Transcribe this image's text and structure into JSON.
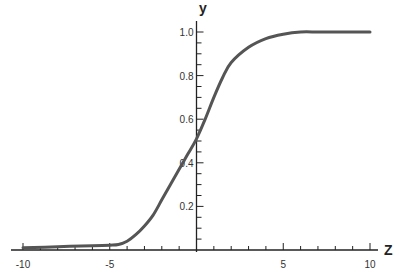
{
  "chart_data": {
    "type": "line",
    "title": "",
    "xlabel": "Z",
    "ylabel": "y",
    "xlim": [
      -10.6,
      11
    ],
    "ylim": [
      0,
      1.05
    ],
    "grid": false,
    "legend": null,
    "x_ticks": [
      -10,
      -5,
      5,
      10
    ],
    "x_tick_labels": [
      "-10",
      "-5",
      "5",
      "10"
    ],
    "x_minor_step": 1,
    "y_ticks": [
      0.2,
      0.4,
      0.6,
      0.8,
      1.0
    ],
    "y_tick_labels": [
      "0.2",
      "0.4",
      "0.6",
      "0.8",
      "1.0"
    ],
    "y_minor_step": 0.05,
    "series": [
      {
        "name": "sigmoid-like curve",
        "color": "#555555",
        "x": [
          -10,
          -8,
          -6,
          -5,
          -4.5,
          -4,
          -3.5,
          -3,
          -2.5,
          -2,
          -1.5,
          -1,
          -0.5,
          0,
          0.5,
          1,
          1.5,
          2,
          3,
          4,
          5,
          6,
          7,
          8,
          9,
          10
        ],
        "y": [
          0.01,
          0.015,
          0.02,
          0.022,
          0.025,
          0.04,
          0.07,
          0.11,
          0.16,
          0.23,
          0.3,
          0.37,
          0.44,
          0.51,
          0.6,
          0.7,
          0.79,
          0.86,
          0.93,
          0.97,
          0.99,
          1.0,
          1.0,
          1.0,
          1.0,
          1.0
        ]
      }
    ]
  }
}
